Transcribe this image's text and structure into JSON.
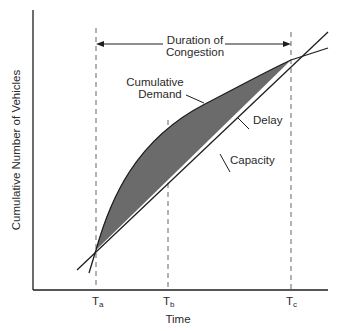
{
  "diagram": {
    "axes": {
      "x_label": "Time",
      "y_label": "Cumulative Number of Vehicles",
      "ticks": [
        {
          "label": "T",
          "sub": "a"
        },
        {
          "label": "T",
          "sub": "b"
        },
        {
          "label": "T",
          "sub": "c"
        }
      ]
    },
    "annotations": {
      "duration_line1": "Duration of",
      "duration_line2": "Congestion",
      "demand_line1": "Cumulative",
      "demand_line2": "Demand",
      "delay": "Delay",
      "capacity": "Capacity"
    },
    "colors": {
      "line": "#1e1e1e",
      "delay_fill": "#6b6b6b",
      "dashed": "#555555",
      "text": "#2a2a2a"
    }
  }
}
